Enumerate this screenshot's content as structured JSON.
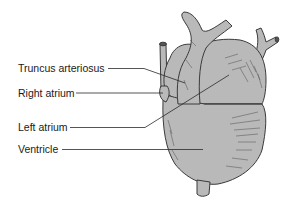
{
  "diagram": {
    "colors": {
      "fill": "#b9b9b9",
      "outline": "#3a3a3a",
      "leader": "#2a2a2a",
      "background": "#ffffff"
    },
    "labels": [
      {
        "id": "truncus-arteriosus",
        "text": "Truncus arteriosus"
      },
      {
        "id": "right-atrium",
        "text": "Right atrium"
      },
      {
        "id": "left-atrium",
        "text": "Left atrium"
      },
      {
        "id": "ventricle",
        "text": "Ventricle"
      }
    ]
  }
}
